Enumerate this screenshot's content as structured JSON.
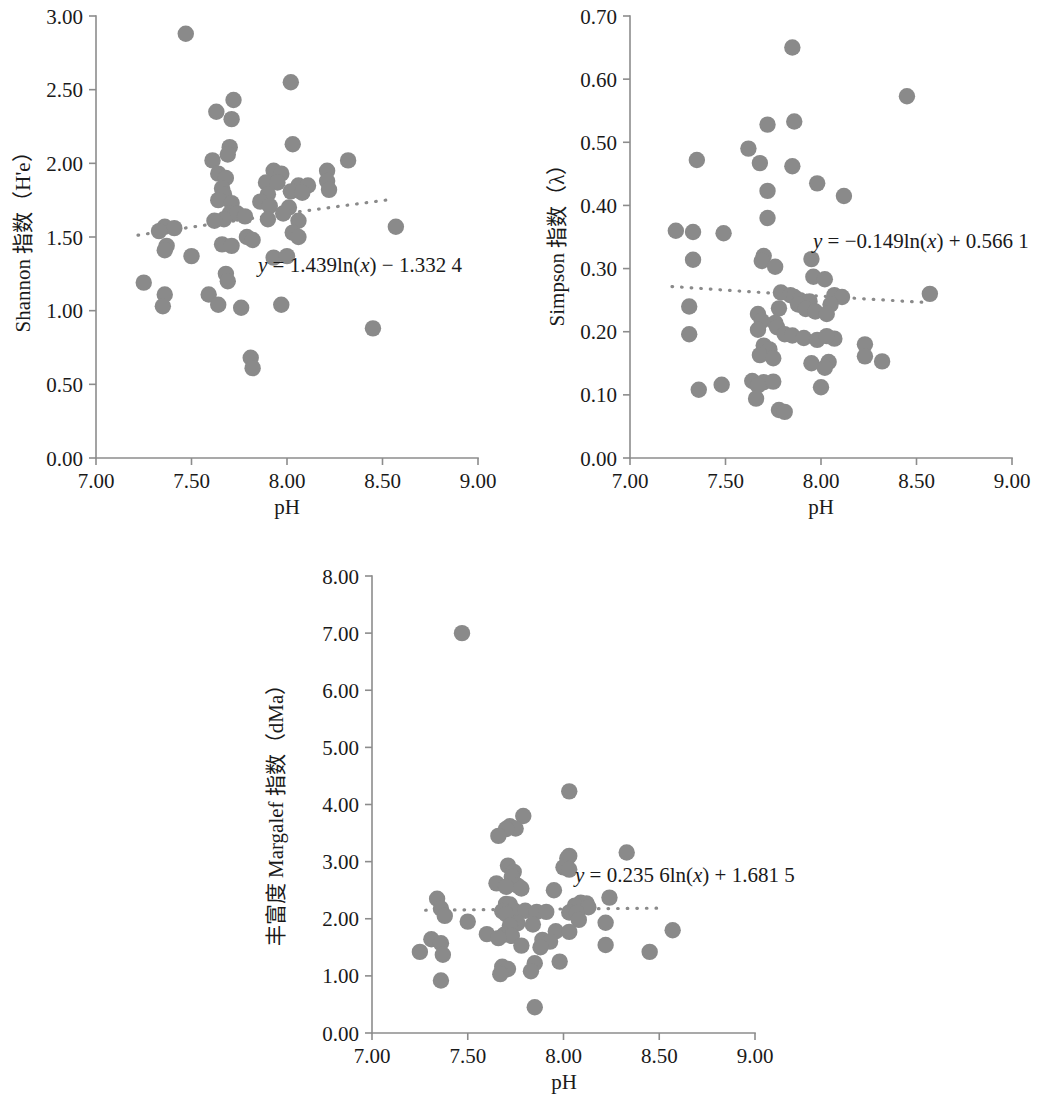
{
  "figure": {
    "marker_color": "#8a8a8a",
    "axis_color": "#8c8c8c",
    "text_color": "#1a1a1a"
  },
  "chart_data": [
    {
      "type": "scatter",
      "id": "shannon",
      "title": "",
      "xlabel": "pH",
      "ylabel": "Shannon 指数（H'e）",
      "ylabel_parts": {
        "name": "Shannon",
        "cjk": "指数",
        "unit": "（H'e）"
      },
      "xlim": [
        7.0,
        9.0
      ],
      "ylim": [
        0.0,
        3.0
      ],
      "xticks": [
        7.0,
        7.5,
        8.0,
        8.5,
        9.0
      ],
      "xtick_labels": [
        "7.00",
        "7.50",
        "8.00",
        "8.50",
        "9.00"
      ],
      "yticks": [
        0.0,
        0.5,
        1.0,
        1.5,
        2.0,
        2.5,
        3.0
      ],
      "ytick_labels": [
        "0.00",
        "0.50",
        "1.00",
        "1.50",
        "2.00",
        "2.50",
        "3.00"
      ],
      "grid": false,
      "legend": "none",
      "annotation": "y = 1.439ln(x) − 1.332 4",
      "annotation_parts": {
        "y": "y",
        "eq": "= 1.439ln(",
        "x": "x",
        "tail": ") − 1.332 4"
      },
      "trendline": {
        "type": "log",
        "a": 1.439,
        "b": -1.3324,
        "x_start": 7.22,
        "x_end": 8.55
      },
      "points": [
        [
          7.47,
          2.88
        ],
        [
          8.02,
          2.55
        ],
        [
          7.72,
          2.43
        ],
        [
          7.63,
          2.35
        ],
        [
          7.71,
          2.3
        ],
        [
          8.03,
          2.13
        ],
        [
          7.7,
          2.11
        ],
        [
          7.69,
          2.06
        ],
        [
          7.61,
          2.02
        ],
        [
          8.32,
          2.02
        ],
        [
          7.93,
          1.95
        ],
        [
          7.64,
          1.93
        ],
        [
          7.97,
          1.93
        ],
        [
          8.21,
          1.95
        ],
        [
          7.68,
          1.9
        ],
        [
          7.89,
          1.87
        ],
        [
          7.95,
          1.87
        ],
        [
          8.06,
          1.85
        ],
        [
          8.11,
          1.85
        ],
        [
          8.21,
          1.88
        ],
        [
          8.22,
          1.82
        ],
        [
          7.66,
          1.83
        ],
        [
          7.67,
          1.79
        ],
        [
          7.9,
          1.79
        ],
        [
          8.02,
          1.81
        ],
        [
          8.08,
          1.8
        ],
        [
          7.64,
          1.75
        ],
        [
          7.71,
          1.73
        ],
        [
          7.86,
          1.74
        ],
        [
          7.91,
          1.71
        ],
        [
          8.01,
          1.7
        ],
        [
          7.7,
          1.66
        ],
        [
          7.74,
          1.66
        ],
        [
          7.78,
          1.64
        ],
        [
          7.9,
          1.62
        ],
        [
          7.98,
          1.66
        ],
        [
          8.06,
          1.61
        ],
        [
          7.67,
          1.62
        ],
        [
          7.62,
          1.61
        ],
        [
          7.36,
          1.57
        ],
        [
          7.41,
          1.56
        ],
        [
          7.33,
          1.54
        ],
        [
          8.57,
          1.57
        ],
        [
          8.03,
          1.53
        ],
        [
          8.06,
          1.5
        ],
        [
          7.79,
          1.5
        ],
        [
          7.82,
          1.48
        ],
        [
          7.37,
          1.44
        ],
        [
          7.66,
          1.45
        ],
        [
          7.71,
          1.44
        ],
        [
          7.36,
          1.41
        ],
        [
          7.5,
          1.37
        ],
        [
          7.93,
          1.36
        ],
        [
          8.0,
          1.37
        ],
        [
          7.68,
          1.25
        ],
        [
          7.69,
          1.2
        ],
        [
          7.25,
          1.19
        ],
        [
          7.36,
          1.11
        ],
        [
          7.59,
          1.11
        ],
        [
          7.35,
          1.03
        ],
        [
          7.64,
          1.04
        ],
        [
          7.76,
          1.02
        ],
        [
          7.97,
          1.04
        ],
        [
          8.45,
          0.88
        ],
        [
          7.81,
          0.68
        ],
        [
          7.82,
          0.61
        ]
      ]
    },
    {
      "type": "scatter",
      "id": "simpson",
      "title": "",
      "xlabel": "pH",
      "ylabel": "Simpson 指数（λ）",
      "ylabel_parts": {
        "name": "Simpson",
        "cjk": "指数",
        "unit": "（λ）"
      },
      "xlim": [
        7.0,
        9.0
      ],
      "ylim": [
        0.0,
        0.7
      ],
      "xticks": [
        7.0,
        7.5,
        8.0,
        8.5,
        9.0
      ],
      "xtick_labels": [
        "7.00",
        "7.50",
        "8.00",
        "8.50",
        "9.00"
      ],
      "yticks": [
        0.0,
        0.1,
        0.2,
        0.3,
        0.4,
        0.5,
        0.6,
        0.7
      ],
      "ytick_labels": [
        "0.00",
        "0.10",
        "0.20",
        "0.30",
        "0.40",
        "0.50",
        "0.60",
        "0.70"
      ],
      "grid": false,
      "legend": "none",
      "annotation": "y = −0.149ln(x) + 0.566 1",
      "annotation_parts": {
        "y": "y",
        "eq": "= −0.149ln(",
        "x": "x",
        "tail": ") + 0.566 1"
      },
      "trendline": {
        "type": "log",
        "a": -0.149,
        "b": 0.5661,
        "x_start": 7.22,
        "x_end": 8.56
      },
      "points": [
        [
          7.85,
          0.65
        ],
        [
          8.45,
          0.573
        ],
        [
          7.86,
          0.533
        ],
        [
          7.72,
          0.528
        ],
        [
          7.62,
          0.49
        ],
        [
          7.35,
          0.472
        ],
        [
          7.68,
          0.467
        ],
        [
          7.85,
          0.462
        ],
        [
          7.98,
          0.435
        ],
        [
          7.72,
          0.423
        ],
        [
          8.12,
          0.415
        ],
        [
          7.72,
          0.38
        ],
        [
          7.24,
          0.36
        ],
        [
          7.33,
          0.358
        ],
        [
          7.49,
          0.356
        ],
        [
          7.33,
          0.314
        ],
        [
          7.7,
          0.32
        ],
        [
          7.69,
          0.312
        ],
        [
          7.95,
          0.315
        ],
        [
          7.76,
          0.303
        ],
        [
          7.96,
          0.287
        ],
        [
          8.02,
          0.283
        ],
        [
          7.79,
          0.262
        ],
        [
          7.84,
          0.258
        ],
        [
          7.86,
          0.255
        ],
        [
          7.89,
          0.25
        ],
        [
          8.07,
          0.258
        ],
        [
          8.11,
          0.255
        ],
        [
          8.57,
          0.26
        ],
        [
          7.94,
          0.248
        ],
        [
          7.88,
          0.243
        ],
        [
          7.31,
          0.24
        ],
        [
          8.05,
          0.243
        ],
        [
          7.78,
          0.237
        ],
        [
          7.92,
          0.236
        ],
        [
          7.97,
          0.232
        ],
        [
          8.03,
          0.228
        ],
        [
          7.67,
          0.228
        ],
        [
          7.69,
          0.217
        ],
        [
          7.76,
          0.214
        ],
        [
          7.77,
          0.207
        ],
        [
          7.67,
          0.203
        ],
        [
          7.31,
          0.196
        ],
        [
          7.81,
          0.196
        ],
        [
          7.85,
          0.194
        ],
        [
          7.91,
          0.19
        ],
        [
          7.98,
          0.187
        ],
        [
          8.07,
          0.189
        ],
        [
          8.03,
          0.193
        ],
        [
          8.23,
          0.18
        ],
        [
          7.7,
          0.178
        ],
        [
          7.73,
          0.172
        ],
        [
          7.68,
          0.163
        ],
        [
          7.75,
          0.158
        ],
        [
          8.23,
          0.161
        ],
        [
          8.32,
          0.153
        ],
        [
          8.04,
          0.152
        ],
        [
          7.95,
          0.15
        ],
        [
          8.02,
          0.143
        ],
        [
          7.64,
          0.122
        ],
        [
          7.7,
          0.12
        ],
        [
          7.75,
          0.121
        ],
        [
          7.48,
          0.116
        ],
        [
          7.67,
          0.115
        ],
        [
          8.0,
          0.112
        ],
        [
          7.36,
          0.108
        ],
        [
          7.66,
          0.094
        ],
        [
          7.78,
          0.076
        ],
        [
          7.81,
          0.073
        ]
      ]
    },
    {
      "type": "scatter",
      "id": "margalef",
      "title": "",
      "xlabel": "pH",
      "ylabel": "丰富度 Margalef 指数（dMa）",
      "ylabel_parts": {
        "cjk_prefix": "丰富度",
        "name": "Margalef",
        "cjk": "指数",
        "unit": "（dMa）"
      },
      "xlim": [
        7.0,
        9.0
      ],
      "ylim": [
        0.0,
        8.0
      ],
      "xticks": [
        7.0,
        7.5,
        8.0,
        8.5,
        9.0
      ],
      "xtick_labels": [
        "7.00",
        "7.50",
        "8.00",
        "8.50",
        "9.00"
      ],
      "yticks": [
        0.0,
        1.0,
        2.0,
        3.0,
        4.0,
        5.0,
        6.0,
        7.0,
        8.0
      ],
      "ytick_labels": [
        "0.00",
        "1.00",
        "2.00",
        "3.00",
        "4.00",
        "5.00",
        "6.00",
        "7.00",
        "8.00"
      ],
      "grid": false,
      "legend": "none",
      "annotation": "y = 0.235 6ln(x) + 1.681 5",
      "annotation_parts": {
        "y": "y",
        "eq": "= 0.235 6ln(",
        "x": "x",
        "tail": ") + 1.681 5"
      },
      "trendline": {
        "type": "log",
        "a": 0.2356,
        "b": 1.6815,
        "x_start": 7.28,
        "x_end": 8.52
      },
      "points": [
        [
          7.47,
          7.0
        ],
        [
          8.03,
          4.23
        ],
        [
          7.79,
          3.8
        ],
        [
          7.72,
          3.62
        ],
        [
          7.75,
          3.58
        ],
        [
          7.7,
          3.57
        ],
        [
          7.66,
          3.45
        ],
        [
          8.33,
          3.16
        ],
        [
          8.03,
          3.1
        ],
        [
          8.02,
          3.06
        ],
        [
          7.71,
          2.93
        ],
        [
          8.0,
          2.9
        ],
        [
          8.03,
          2.86
        ],
        [
          7.74,
          2.82
        ],
        [
          7.73,
          2.73
        ],
        [
          7.65,
          2.62
        ],
        [
          7.76,
          2.58
        ],
        [
          7.7,
          2.56
        ],
        [
          7.78,
          2.53
        ],
        [
          7.95,
          2.5
        ],
        [
          7.34,
          2.35
        ],
        [
          8.24,
          2.37
        ],
        [
          8.09,
          2.28
        ],
        [
          8.12,
          2.27
        ],
        [
          7.7,
          2.26
        ],
        [
          7.72,
          2.25
        ],
        [
          8.06,
          2.23
        ],
        [
          8.13,
          2.2
        ],
        [
          7.36,
          2.18
        ],
        [
          7.74,
          2.15
        ],
        [
          7.8,
          2.14
        ],
        [
          7.68,
          2.13
        ],
        [
          7.86,
          2.12
        ],
        [
          7.91,
          2.12
        ],
        [
          8.03,
          2.11
        ],
        [
          8.07,
          2.1
        ],
        [
          7.7,
          2.08
        ],
        [
          7.38,
          2.05
        ],
        [
          8.08,
          1.98
        ],
        [
          7.5,
          1.95
        ],
        [
          8.22,
          1.93
        ],
        [
          7.76,
          1.92
        ],
        [
          7.84,
          1.9
        ],
        [
          7.72,
          1.88
        ],
        [
          8.57,
          1.8
        ],
        [
          7.96,
          1.78
        ],
        [
          8.03,
          1.77
        ],
        [
          7.6,
          1.73
        ],
        [
          7.69,
          1.72
        ],
        [
          7.73,
          1.7
        ],
        [
          7.66,
          1.66
        ],
        [
          7.31,
          1.64
        ],
        [
          7.89,
          1.63
        ],
        [
          7.93,
          1.6
        ],
        [
          8.22,
          1.54
        ],
        [
          7.36,
          1.57
        ],
        [
          7.78,
          1.53
        ],
        [
          7.88,
          1.5
        ],
        [
          7.25,
          1.42
        ],
        [
          7.37,
          1.37
        ],
        [
          8.45,
          1.42
        ],
        [
          7.98,
          1.25
        ],
        [
          7.85,
          1.22
        ],
        [
          7.68,
          1.16
        ],
        [
          7.71,
          1.12
        ],
        [
          7.83,
          1.08
        ],
        [
          7.67,
          1.03
        ],
        [
          7.36,
          0.92
        ],
        [
          7.85,
          0.45
        ]
      ]
    }
  ]
}
